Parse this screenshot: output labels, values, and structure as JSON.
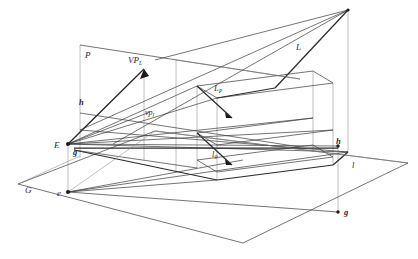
{
  "figure": {
    "background_color": "#ffffff",
    "line_color": "#3a3a3a",
    "accent_color": "#2b2b2b",
    "width": 418,
    "height": 259
  },
  "labels": {
    "plane_picture": "P",
    "plane_ground": "G",
    "eye_point": "E",
    "eye_ground": "e",
    "vanishing_point_upper": "VP",
    "vanishing_point_upper_sub": "L",
    "vanishing_point_lower": "vp",
    "vanishing_point_lower_sub": "l",
    "line_L": "L",
    "line_LP": "L",
    "line_LP_sub": "P",
    "line_l0": "l",
    "line_l0_sub": "0",
    "line_l": "l",
    "h_left": "h",
    "h_right": "h",
    "g_left": "g",
    "g_right": "g"
  },
  "points": {
    "E": [
      68,
      144
    ],
    "e": [
      68,
      192
    ],
    "g_left": [
      74,
      148
    ],
    "P_topleft": [
      80,
      45
    ],
    "P_topright": [
      176,
      60
    ],
    "P_botleft": [
      80,
      156
    ],
    "P_botright": [
      176,
      156
    ],
    "h_line_left": [
      80,
      113
    ],
    "h_line_right": [
      176,
      125
    ],
    "VP_upper": [
      144,
      69
    ],
    "vp_lower": [
      150,
      112
    ],
    "ground_left": [
      18,
      184
    ],
    "ground_top": [
      155,
      131
    ],
    "ground_right": [
      408,
      163
    ],
    "ground_bottom": [
      243,
      243
    ],
    "L_far_top": [
      348,
      10
    ],
    "L_near": [
      208,
      148
    ],
    "box_front_tl": [
      197,
      86
    ],
    "box_front_bl": [
      197,
      160
    ],
    "box_back_tl": [
      217,
      98
    ],
    "box_back_bl": [
      217,
      169
    ],
    "box_right_tr": [
      313,
      71
    ],
    "box_right_br": [
      313,
      145
    ],
    "box_far_tr": [
      333,
      83
    ],
    "box_far_br": [
      333,
      154
    ],
    "h_right_pt": [
      338,
      146
    ],
    "g_right_pt": [
      345,
      212
    ],
    "l_label": [
      352,
      165
    ]
  },
  "label_positions": {
    "P": [
      85,
      56
    ],
    "G": [
      28,
      190
    ],
    "E": [
      57,
      148
    ],
    "e": [
      59,
      196
    ],
    "g_left": [
      75,
      153
    ],
    "VP": [
      131,
      61
    ],
    "vp": [
      147,
      113
    ],
    "L": [
      297,
      48
    ],
    "LP": [
      216,
      89
    ],
    "l0": [
      213,
      155
    ],
    "h_left": [
      82,
      102
    ],
    "h_right": [
      341,
      142
    ],
    "l": [
      354,
      166
    ],
    "g_right": [
      349,
      214
    ]
  }
}
